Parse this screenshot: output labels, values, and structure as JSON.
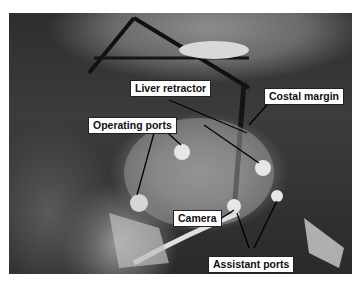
{
  "figure": {
    "labels": {
      "liver_retractor": "Liver retractor",
      "costal_margin": "Costal margin",
      "operating_ports": "Operating ports",
      "camera": "Camera",
      "assistant_ports": "Assistant ports"
    }
  }
}
